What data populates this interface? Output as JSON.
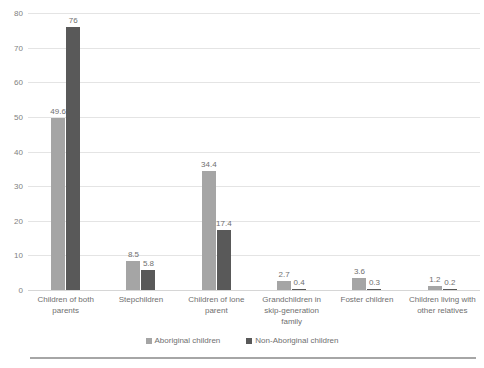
{
  "chart_data": {
    "type": "bar",
    "title": "",
    "xlabel": "",
    "ylabel": "",
    "ylim": [
      0,
      80
    ],
    "yticks": [
      "0",
      "10",
      "20",
      "30",
      "40",
      "50",
      "60",
      "70",
      "80"
    ],
    "grid": true,
    "legend_position": "bottom",
    "categories": [
      "Children of both parents",
      "Stepchildren",
      "Children of lone parent",
      "Grandchildren in skip-generation family",
      "Foster children",
      "Children living with other relatives"
    ],
    "series": [
      {
        "name": "Aboriginal children",
        "color": "#a5a5a5",
        "values": [
          49.6,
          8.5,
          34.4,
          2.7,
          3.6,
          1.2
        ],
        "labels": [
          "49.6",
          "8.5",
          "34.4",
          "2.7",
          "3.6",
          "1.2"
        ]
      },
      {
        "name": "Non-Aboriginal children",
        "color": "#595959",
        "values": [
          76,
          5.8,
          17.4,
          0.4,
          0.3,
          0.2
        ],
        "labels": [
          "76",
          "5.8",
          "17.4",
          "0.4",
          "0.3",
          "0.2"
        ]
      }
    ]
  },
  "legend": {
    "items": [
      {
        "label": "Aboriginal children",
        "color": "#a5a5a5"
      },
      {
        "label": "Non-Aboriginal children",
        "color": "#595959"
      }
    ]
  },
  "colors": {
    "series_a": "#a5a5a5",
    "series_b": "#595959",
    "gridline": "#e4e4e4",
    "axis_text": "#7f7f7f",
    "rule": "#a6a6a6",
    "background": "#ffffff"
  }
}
